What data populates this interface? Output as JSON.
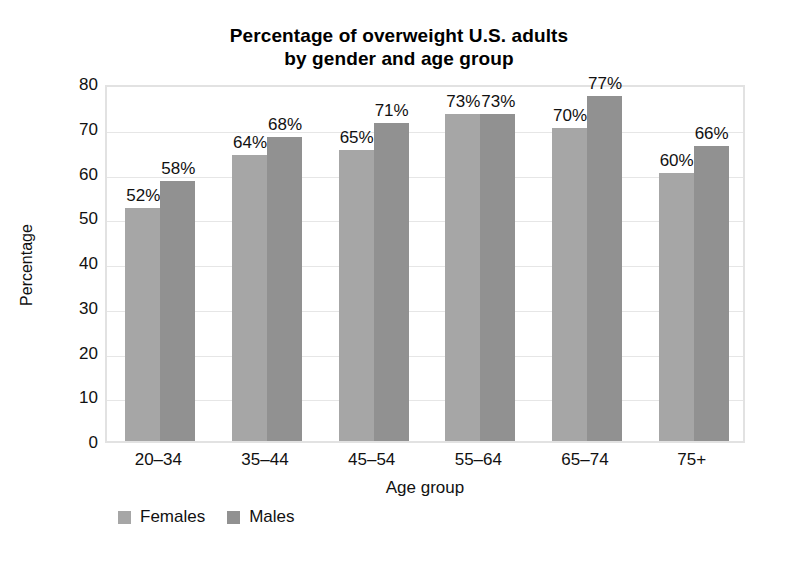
{
  "chart_data": {
    "type": "bar",
    "title": "Percentage of overweight U.S. adults by gender and age group",
    "title_line1": "Percentage of overweight U.S. adults",
    "title_line2": "by gender and age group",
    "xlabel": "Age group",
    "ylabel": "Percentage",
    "categories": [
      "20–34",
      "35–44",
      "45–54",
      "55–64",
      "65–74",
      "75+"
    ],
    "series": [
      {
        "name": "Females",
        "color": "#a6a6a6",
        "values": [
          52,
          64,
          65,
          73,
          70,
          60
        ],
        "labels": [
          "52%",
          "64%",
          "65%",
          "73%",
          "70%",
          "60%"
        ]
      },
      {
        "name": "Males",
        "color": "#919191",
        "values": [
          58,
          68,
          71,
          73,
          77,
          66
        ],
        "labels": [
          "58%",
          "68%",
          "71%",
          "73%",
          "77%",
          "66%"
        ]
      }
    ],
    "ylim": [
      0,
      80
    ],
    "y_ticks": [
      80,
      70,
      60,
      50,
      40,
      30,
      20,
      10,
      0
    ],
    "y_tick_labels": [
      "80",
      "70",
      "60",
      "50",
      "40",
      "30",
      "20",
      "10",
      "0"
    ],
    "grid": true,
    "grid_axis": "y",
    "legend_position": "bottom-left",
    "value_labels_shown": true,
    "plot_border_color": "#e2e2e2",
    "gridline_color": "#e6e6e6",
    "background_color": "#ffffff"
  }
}
